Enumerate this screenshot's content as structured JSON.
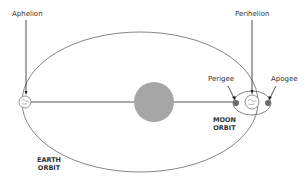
{
  "labels": {
    "aphelion": "Aphelion",
    "perihelion": "Perihelion",
    "perigee": "Perigee",
    "apogee": "Apogee",
    "moon_orbit_line1": "MOON",
    "moon_orbit_line2": "ORBIT",
    "earth_orbit_line1": "EARTH",
    "earth_orbit_line2": "ORBIT"
  },
  "colors": {
    "orbit_stroke": "#666666",
    "sun_fill": "#a6a6a6",
    "moon_dot": "#6b6b6b",
    "pointer": "#222222"
  }
}
